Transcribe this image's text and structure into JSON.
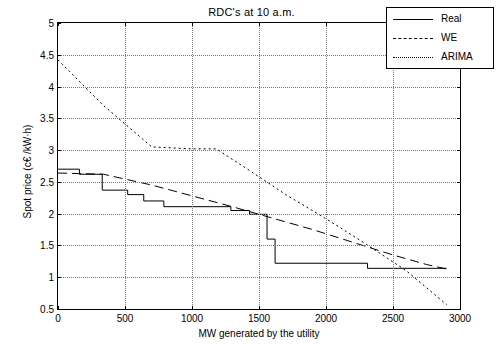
{
  "chart_data": {
    "type": "line",
    "title": "RDC's at 10 a.m.",
    "xlabel": "MW generated by the utility",
    "ylabel": "Spot price (c€ /kW·h)",
    "xlim": [
      0,
      3000
    ],
    "ylim": [
      0.5,
      5
    ],
    "xticks": [
      0,
      500,
      1000,
      1500,
      2000,
      2500,
      3000
    ],
    "yticks": [
      0.5,
      1,
      1.5,
      2,
      2.5,
      3,
      3.5,
      4,
      4.5,
      5
    ],
    "grid": true,
    "legend_position": "top-right",
    "series": [
      {
        "name": "Real",
        "style": "solid",
        "points": [
          [
            0,
            2.7
          ],
          [
            160,
            2.7
          ],
          [
            160,
            2.62
          ],
          [
            330,
            2.62
          ],
          [
            330,
            2.37
          ],
          [
            520,
            2.37
          ],
          [
            520,
            2.3
          ],
          [
            640,
            2.3
          ],
          [
            640,
            2.2
          ],
          [
            790,
            2.2
          ],
          [
            790,
            2.11
          ],
          [
            1290,
            2.11
          ],
          [
            1290,
            2.05
          ],
          [
            1430,
            2.05
          ],
          [
            1430,
            1.99
          ],
          [
            1560,
            1.99
          ],
          [
            1560,
            1.6
          ],
          [
            1620,
            1.6
          ],
          [
            1620,
            1.22
          ],
          [
            2310,
            1.22
          ],
          [
            2310,
            1.14
          ],
          [
            2900,
            1.14
          ]
        ]
      },
      {
        "name": "WE",
        "style": "dashed",
        "points": [
          [
            0,
            2.64
          ],
          [
            340,
            2.62
          ],
          [
            700,
            2.45
          ],
          [
            1000,
            2.28
          ],
          [
            1300,
            2.11
          ],
          [
            1600,
            1.93
          ],
          [
            1900,
            1.75
          ],
          [
            2200,
            1.55
          ],
          [
            2500,
            1.35
          ],
          [
            2750,
            1.2
          ],
          [
            2900,
            1.13
          ]
        ]
      },
      {
        "name": "ARIMA",
        "style": "dotted",
        "points": [
          [
            0,
            4.42
          ],
          [
            340,
            3.7
          ],
          [
            700,
            3.05
          ],
          [
            1000,
            3.02
          ],
          [
            1180,
            3.02
          ],
          [
            1400,
            2.72
          ],
          [
            1700,
            2.3
          ],
          [
            2000,
            1.92
          ],
          [
            2300,
            1.52
          ],
          [
            2600,
            1.1
          ],
          [
            2900,
            0.57
          ]
        ]
      }
    ]
  },
  "legend": {
    "items": [
      {
        "label": "Real"
      },
      {
        "label": "WE"
      },
      {
        "label": "ARIMA"
      }
    ]
  }
}
